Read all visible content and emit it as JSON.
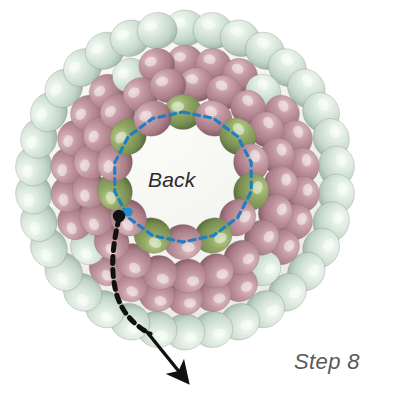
{
  "figure": {
    "kind": "beaded-sphere-diagram",
    "title_label": "Back",
    "step_label": "Step 8",
    "canvas": {
      "width": 397,
      "height": 394,
      "background": "#ffffff"
    },
    "sphere": {
      "center_x": 185,
      "center_y": 180,
      "radius": 168,
      "inner_fill": "#f2f2ee",
      "inner_fill_highlight": "#fbfbf8"
    },
    "colors": {
      "outer_bead_mint": "#cfded2",
      "outer_bead_mint_light": "#eaf3ea",
      "outer_bead_mint_dark": "#a8bfae",
      "body_bead_rose": "#b2848e",
      "body_bead_rose_light": "#d7b3ba",
      "body_bead_rose_dark": "#8d636e",
      "inner_bead_green": "#7d9356",
      "inner_bead_green_light": "#a8bd7c",
      "inner_bead_green_dark": "#5e7340",
      "dashed_path_blue": "#1f7fc4",
      "marker_black": "#111111",
      "marker_blue": "#1f8ed2",
      "arrow_black": "#111111",
      "back_text": "#2b2b2b",
      "step_text": "#5a5a5a"
    },
    "markers": [
      {
        "name": "start-point-black",
        "x": 119,
        "y": 216,
        "r": 6.2,
        "color": "#111111"
      },
      {
        "name": "start-point-blue",
        "x": 128,
        "y": 212,
        "r": 4.6,
        "color": "#1f8ed2"
      }
    ],
    "exit_path": {
      "name": "thread-exit-path",
      "dashed_d": "M 119 218 C 113 244, 110 268, 116 292 C 121 312, 134 325, 150 334",
      "solid_d": "M 147 332 L 181 374",
      "arrow_tip_x": 184,
      "arrow_tip_y": 379,
      "dash_pattern": "7 6",
      "stroke_width": 5
    },
    "inner_ring": {
      "name": "inner-bead-ring",
      "center_x": 183,
      "center_y": 177,
      "radius_x": 70,
      "radius_y": 65,
      "bead_count": 14,
      "green_indices": [
        0,
        2,
        4,
        6,
        8,
        10,
        12
      ],
      "dash_pattern": "6 5",
      "dash_width": 3.2
    },
    "outer_ring": {
      "name": "outer-bead-rim",
      "bead_count": 34,
      "radius": 152,
      "bead_rx": 20,
      "bead_ry": 18
    },
    "body_rings": [
      {
        "name": "body-ring-outer",
        "radius": 118,
        "bead_count": 26,
        "bead_rx": 18,
        "bead_ry": 17
      },
      {
        "name": "body-ring-mid",
        "radius": 96,
        "bead_count": 21,
        "bead_rx": 18,
        "bead_ry": 17
      }
    ]
  }
}
